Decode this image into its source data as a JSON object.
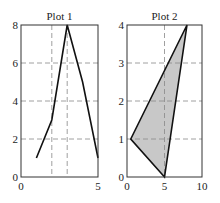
{
  "chart_data": [
    {
      "type": "line",
      "title": "Plot 1",
      "x": [
        1,
        2,
        3,
        4,
        5
      ],
      "values": [
        1,
        3,
        8,
        5,
        1
      ],
      "xlabel": "",
      "ylabel": "",
      "xlim": [
        0,
        5
      ],
      "ylim": [
        0,
        8
      ],
      "xticks": [
        "0",
        "5"
      ],
      "yticks": [
        "0",
        "2",
        "4",
        "6",
        "8"
      ],
      "grid": true,
      "grid_x": [
        2,
        3
      ],
      "grid_y": [
        2,
        4,
        6
      ]
    },
    {
      "type": "area",
      "title": "Plot 2",
      "polygon": [
        [
          0.5,
          1
        ],
        [
          8,
          4
        ],
        [
          5,
          0
        ]
      ],
      "fill_color": "#c8c8c8",
      "xlabel": "",
      "ylabel": "",
      "xlim": [
        0,
        10
      ],
      "ylim": [
        0,
        4
      ],
      "xticks": [
        "0",
        "5",
        "10"
      ],
      "yticks": [
        "0",
        "1",
        "2",
        "3",
        "4"
      ],
      "grid": true,
      "grid_x": [
        5
      ],
      "grid_y": [
        1,
        2,
        3
      ]
    }
  ]
}
